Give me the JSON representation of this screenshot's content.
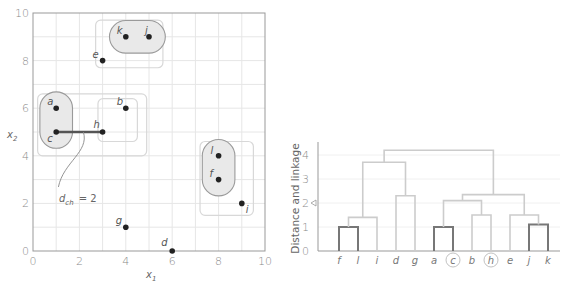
{
  "chart_data": [
    {
      "type": "scatter",
      "title": "",
      "xlabel": "x1",
      "ylabel": "x2",
      "xlim": [
        0,
        10
      ],
      "ylim": [
        0,
        10
      ],
      "xticks": [
        0,
        2,
        4,
        6,
        8,
        10
      ],
      "yticks": [
        0,
        2,
        4,
        6,
        8,
        10
      ],
      "grid": true,
      "points": [
        {
          "label": "a",
          "x": 1,
          "y": 6
        },
        {
          "label": "b",
          "x": 4,
          "y": 6
        },
        {
          "label": "c",
          "x": 1,
          "y": 5
        },
        {
          "label": "d",
          "x": 6,
          "y": 0
        },
        {
          "label": "e",
          "x": 3,
          "y": 8
        },
        {
          "label": "f",
          "x": 8,
          "y": 3
        },
        {
          "label": "g",
          "x": 4,
          "y": 1
        },
        {
          "label": "h",
          "x": 3,
          "y": 5
        },
        {
          "label": "i",
          "x": 9,
          "y": 2
        },
        {
          "label": "j",
          "x": 5,
          "y": 9
        },
        {
          "label": "k",
          "x": 4,
          "y": 9
        },
        {
          "label": "l",
          "x": 8,
          "y": 4
        }
      ],
      "clusters_inner": [
        [
          "k",
          "j"
        ],
        [
          "a",
          "c"
        ],
        [
          "l",
          "f"
        ]
      ],
      "clusters_outer": [
        [
          "k",
          "j",
          "e"
        ],
        [
          "b",
          "h"
        ],
        [
          "a",
          "c",
          "b",
          "h"
        ],
        [
          "l",
          "f",
          "i"
        ]
      ],
      "annotation": {
        "text": "d_ch = 2",
        "segment": [
          "c",
          "h"
        ],
        "value": 2
      }
    },
    {
      "type": "dendrogram",
      "title": "",
      "xlabel": "",
      "ylabel": "Distance and linkage",
      "ylim": [
        0,
        4.5
      ],
      "yticks": [
        0,
        1,
        2,
        3,
        4
      ],
      "leaves": [
        "f",
        "l",
        "i",
        "d",
        "g",
        "a",
        "c",
        "b",
        "h",
        "e",
        "j",
        "k"
      ],
      "highlighted_leaves": [
        "c",
        "h"
      ],
      "marker": {
        "symbol": "triangle-left",
        "y": 2
      },
      "merges": [
        {
          "children": [
            "f",
            "l"
          ],
          "height": 1.0,
          "emphasized": true
        },
        {
          "children": [
            "a",
            "c"
          ],
          "height": 1.0,
          "emphasized": true
        },
        {
          "children": [
            "j",
            "k"
          ],
          "height": 1.1,
          "emphasized": true
        },
        {
          "children": [
            "f,l",
            "i"
          ],
          "height": 1.4
        },
        {
          "children": [
            "b",
            "h"
          ],
          "height": 1.5
        },
        {
          "children": [
            "e",
            "j,k"
          ],
          "height": 1.5
        },
        {
          "children": [
            "a,c",
            "b,h"
          ],
          "height": 2.1
        },
        {
          "children": [
            "d",
            "g"
          ],
          "height": 2.3
        },
        {
          "children": [
            "a,c,b,h",
            "e,j,k"
          ],
          "height": 2.35
        },
        {
          "children": [
            "f,l,i",
            "d,g"
          ],
          "height": 3.7
        },
        {
          "children": [
            "f,l,i,d,g",
            "a,c,b,h,e,j,k"
          ],
          "height": 4.2
        }
      ]
    }
  ],
  "scatter": {
    "xlabel": "x",
    "xlabel_sub": "1",
    "ylabel": "x",
    "ylabel_sub": "2",
    "annotation_main": "d",
    "annotation_sub": "ch",
    "annotation_value": "= 2"
  },
  "dendrogram": {
    "ylabel": "Distance and linkage"
  },
  "colors": {
    "grid": "#e6e6e6",
    "axis": "#999999",
    "point": "#222222",
    "cluster_fill": "#e9e9e9",
    "cluster_stroke": "#9a9a9a",
    "outer_box": "#d8d8d8",
    "link_light": "#cccccc",
    "link_dark": "#777777",
    "segment": "#555555"
  }
}
